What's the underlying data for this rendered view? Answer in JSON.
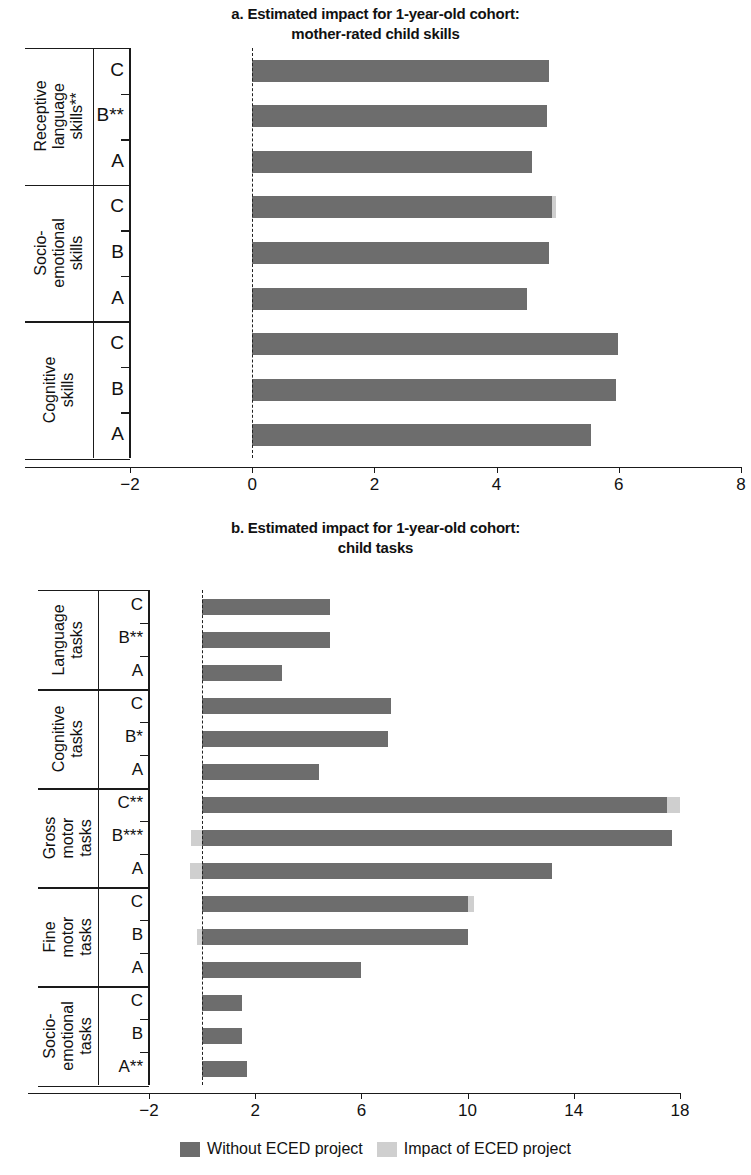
{
  "figure": {
    "legend": [
      {
        "label": "Without ECED project",
        "color": "#6d6d6d",
        "key": "without"
      },
      {
        "label": "Impact of ECED project",
        "color": "#cfcfcf",
        "key": "impact"
      }
    ]
  },
  "chart_data": [
    {
      "id": "panel-a",
      "type": "bar",
      "orientation": "horizontal",
      "stacked": true,
      "title": "a. Estimated impact for 1-year-old cohort:\nmother-rated child skills",
      "title_line1": "a. Estimated impact for 1-year-old cohort:",
      "title_line2": "mother-rated child skills",
      "xlabel": "",
      "ylabel": "",
      "xlim": [
        -2,
        8
      ],
      "xticks": [
        -2,
        0,
        2,
        4,
        6,
        8
      ],
      "xticklabels": [
        "−2",
        "0",
        "2",
        "4",
        "6",
        "8"
      ],
      "grid": false,
      "zero_reference_line": 0,
      "groups": [
        {
          "name": "Receptive language skills**",
          "label_lines": "Receptive\nlanguage\nskills**",
          "categories": [
            "C",
            "B**",
            "A"
          ],
          "series": [
            {
              "name": "Without ECED project",
              "values": [
                4.86,
                4.83,
                4.58
              ]
            },
            {
              "name": "Impact of ECED project",
              "values": [
                0,
                0,
                0
              ]
            }
          ]
        },
        {
          "name": "Socio-emotional skills",
          "label_lines": "Socio-\nemotional\nskills",
          "categories": [
            "C",
            "B",
            "A"
          ],
          "series": [
            {
              "name": "Without ECED project",
              "values": [
                4.9,
                4.85,
                4.5
              ]
            },
            {
              "name": "Impact of ECED project",
              "values": [
                0.08,
                0,
                0
              ]
            }
          ]
        },
        {
          "name": "Cognitive skills",
          "label_lines": "Cognitive skills",
          "categories": [
            "C",
            "B",
            "A"
          ],
          "series": [
            {
              "name": "Without ECED project",
              "values": [
                5.98,
                5.95,
                5.55
              ]
            },
            {
              "name": "Impact of ECED project",
              "values": [
                0,
                0,
                0
              ]
            }
          ]
        }
      ]
    },
    {
      "id": "panel-b",
      "type": "bar",
      "orientation": "horizontal",
      "stacked": true,
      "title": "b. Estimated impact for 1-year-old cohort:\nchild tasks",
      "title_line1": "b. Estimated impact for 1-year-old cohort:",
      "title_line2": "child tasks",
      "xlabel": "",
      "ylabel": "",
      "xlim": [
        -2,
        20
      ],
      "xticks": [
        -2,
        2,
        6,
        10,
        14,
        18
      ],
      "xticklabels": [
        "−2",
        "2",
        "6",
        "10",
        "14",
        "18"
      ],
      "grid": false,
      "zero_reference_line": 0,
      "groups": [
        {
          "name": "Language tasks",
          "label_lines": "Language\ntasks",
          "categories": [
            "C",
            "B**",
            "A"
          ],
          "series": [
            {
              "name": "Without ECED project",
              "values": [
                4.83,
                4.83,
                3.0
              ]
            },
            {
              "name": "Impact of ECED project",
              "values": [
                0,
                0,
                0
              ]
            }
          ]
        },
        {
          "name": "Cognitive tasks",
          "label_lines": "Cognitive\ntasks",
          "categories": [
            "C",
            "B*",
            "A"
          ],
          "series": [
            {
              "name": "Without ECED project",
              "values": [
                7.1,
                7.0,
                4.4
              ]
            },
            {
              "name": "Impact of ECED project",
              "values": [
                0,
                0,
                0
              ]
            }
          ]
        },
        {
          "name": "Gross motor tasks",
          "label_lines": "Gross motor\ntasks",
          "categories": [
            "C**",
            "B***",
            "A"
          ],
          "series": [
            {
              "name": "Without ECED project",
              "values": [
                17.5,
                17.7,
                13.2
              ]
            },
            {
              "name": "Impact of ECED project",
              "values": [
                0.5,
                -0.4,
                -0.45
              ]
            }
          ]
        },
        {
          "name": "Fine motor tasks",
          "label_lines": "Fine motor\ntasks",
          "categories": [
            "C",
            "B",
            "A"
          ],
          "series": [
            {
              "name": "Without ECED project",
              "values": [
                10.0,
                10.0,
                6.0
              ]
            },
            {
              "name": "Impact of ECED project",
              "values": [
                0.25,
                -0.2,
                0
              ]
            }
          ]
        },
        {
          "name": "Socio-emotional tasks",
          "label_lines": "Socio-\nemotional\ntasks",
          "categories": [
            "C",
            "B",
            "A**"
          ],
          "series": [
            {
              "name": "Without ECED project",
              "values": [
                1.5,
                1.5,
                1.7
              ]
            },
            {
              "name": "Impact of ECED project",
              "values": [
                0,
                0,
                0
              ]
            }
          ]
        }
      ]
    }
  ]
}
